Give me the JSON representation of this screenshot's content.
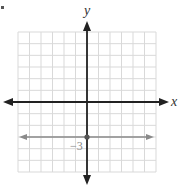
{
  "chart_data": {
    "type": "line",
    "title": "",
    "xlabel": "x",
    "ylabel": "y",
    "xlim": [
      -6,
      6
    ],
    "ylim": [
      -6,
      6
    ],
    "grid": true,
    "series": [
      {
        "name": "y = -3",
        "x": [
          -6,
          6
        ],
        "values": [
          -3,
          -3
        ],
        "color": "#8a8a8a"
      }
    ],
    "points": [
      {
        "x": 0,
        "y": -3
      }
    ],
    "annotations": [
      {
        "text": "−3",
        "x": 0,
        "y": -3
      }
    ]
  },
  "axes": {
    "x_label": "x",
    "y_label": "y",
    "tick_label": "−3"
  },
  "colors": {
    "grid": "#d9d9d9",
    "axis": "#222222",
    "line": "#8a8a8a"
  }
}
